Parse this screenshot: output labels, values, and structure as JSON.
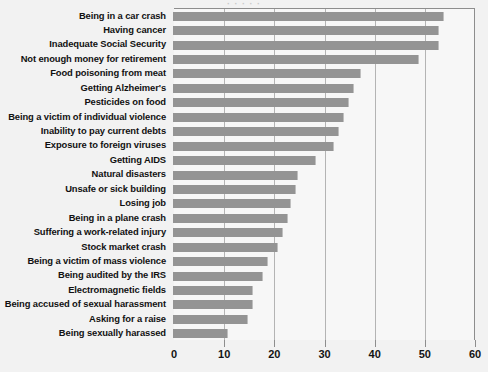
{
  "title_strip": "· · · · ·",
  "colors": {
    "bar": "#949494",
    "plot_background": "#f7f7f7",
    "page_background": "#f2f2f2",
    "gridline": "#b4b4b4",
    "axis": "#8d8d8d",
    "text": "#111111"
  },
  "axis": {
    "ticks": [
      "0",
      "10",
      "20",
      "30",
      "40",
      "50",
      "60"
    ],
    "tick_values": [
      0,
      10,
      20,
      30,
      40,
      50,
      60
    ],
    "xlabel": "",
    "ylabel": ""
  },
  "chart_data": {
    "type": "bar",
    "orientation": "horizontal",
    "title": "",
    "xlabel": "",
    "ylabel": "",
    "xlim": [
      0,
      60
    ],
    "grid": true,
    "legend": false,
    "categories": [
      "Being in a car crash",
      "Having cancer",
      "Inadequate Social Security",
      "Not enough money for retirement",
      "Food poisoning from meat",
      "Getting Alzheimer's",
      "Pesticides on food",
      "Being a victim of individual violence",
      "Inability to pay current debts",
      "Exposure to foreign viruses",
      "Getting AIDS",
      "Natural disasters",
      "Unsafe or sick building",
      "Losing job",
      "Being in a plane crash",
      "Suffering a work-related injury",
      "Stock market crash",
      "Being a victim of mass violence",
      "Being audited by the IRS",
      "Electromagnetic fields",
      "Being accused of sexual harassment",
      "Asking for a raise",
      "Being sexually harassed"
    ],
    "values": [
      54,
      53,
      53,
      49,
      37.5,
      36,
      35,
      34,
      33,
      32,
      28.5,
      25,
      24.5,
      23.5,
      23,
      22,
      21,
      19,
      18,
      16,
      16,
      15,
      11
    ]
  }
}
